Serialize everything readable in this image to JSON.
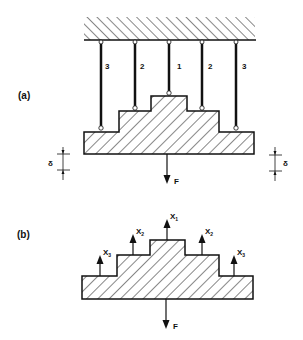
{
  "panel_a": {
    "label": "(a)",
    "rods": [
      {
        "id": "rod-left-3",
        "label": "3"
      },
      {
        "id": "rod-left-2",
        "label": "2"
      },
      {
        "id": "rod-center-1",
        "label": "1"
      },
      {
        "id": "rod-right-2",
        "label": "2"
      },
      {
        "id": "rod-right-3",
        "label": "3"
      }
    ],
    "delta_left": "δ",
    "delta_right": "δ",
    "force": "F"
  },
  "panel_b": {
    "label": "(b)",
    "reactions": [
      {
        "sym": "X",
        "sub": "3"
      },
      {
        "sym": "X",
        "sub": "2"
      },
      {
        "sym": "X",
        "sub": "1"
      },
      {
        "sym": "X",
        "sub": "2"
      },
      {
        "sym": "X",
        "sub": "3"
      }
    ],
    "force": "F"
  },
  "colors": {
    "ink": "#111111",
    "background": "#ffffff"
  }
}
